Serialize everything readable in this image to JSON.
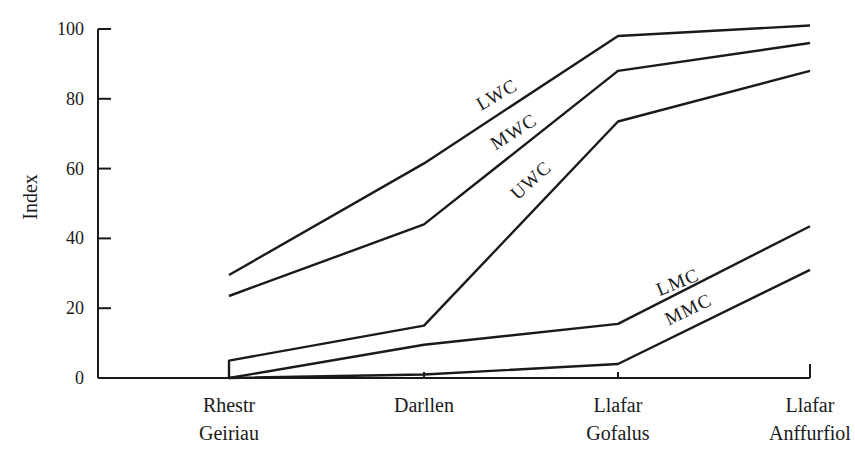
{
  "chart_data": {
    "type": "line",
    "title": "",
    "xlabel": "",
    "ylabel": "Index",
    "ylim": [
      0,
      100
    ],
    "yticks": [
      0,
      20,
      40,
      60,
      80,
      100
    ],
    "grid": false,
    "legend_position": "inline labels on lines",
    "categories": [
      "Rhestr Geiriau",
      "Darllen",
      "Llafar Gofalus",
      "Llafar Anffurfiol"
    ],
    "category_lines": [
      [
        "Rhestr",
        "Geiriau"
      ],
      [
        "Darllen"
      ],
      [
        "Llafar",
        "Gofalus"
      ],
      [
        "Llafar",
        "Anffurfiol"
      ]
    ],
    "series": [
      {
        "name": "LWC",
        "values": [
          29.5,
          61.5,
          98,
          101
        ]
      },
      {
        "name": "MWC",
        "values": [
          23.5,
          44,
          88,
          96
        ]
      },
      {
        "name": "UWC",
        "values": [
          5,
          15,
          73.5,
          88
        ]
      },
      {
        "name": "LMC",
        "values": [
          0,
          9.5,
          15.5,
          43.5
        ]
      },
      {
        "name": "MMC",
        "values": [
          0,
          1,
          4,
          31
        ]
      }
    ]
  }
}
